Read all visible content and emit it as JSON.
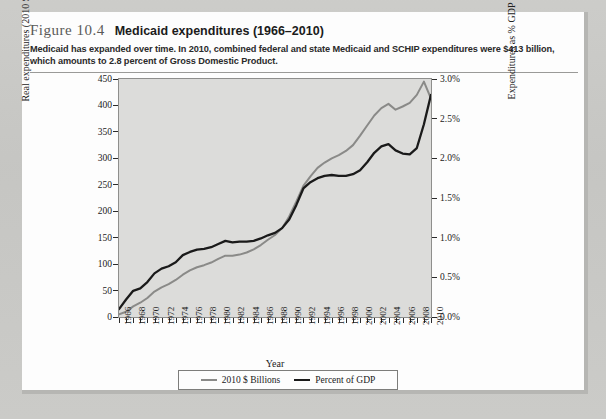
{
  "figure": {
    "label": "Figure 10.4",
    "title": "Medicaid expenditures (1966–2010)",
    "description": "Medicaid has expanded over time. In 2010, combined federal and state Medicaid and SCHIP expenditures were $413 billion, which amounts to 2.8 percent of Gross Domestic Product."
  },
  "legend": {
    "items": [
      {
        "label": "2010 $ Billions",
        "color": "#8a8a88"
      },
      {
        "label": "Percent of GDP",
        "color": "#1a1a1a"
      }
    ]
  },
  "chart_data": {
    "type": "line",
    "title": "Medicaid expenditures (1966–2010)",
    "xlabel": "Year",
    "ylabel": "Real expenditures (2010 $ billions)",
    "y2label": "Expenditures as % GDP",
    "xlim": [
      1966,
      2010
    ],
    "ylim": [
      0,
      450
    ],
    "y2lim": [
      0.0,
      3.0
    ],
    "grid": false,
    "legend_position": "bottom",
    "plot_background": "#dcdcda",
    "x": [
      1966,
      1967,
      1968,
      1969,
      1970,
      1971,
      1972,
      1973,
      1974,
      1975,
      1976,
      1977,
      1978,
      1979,
      1980,
      1981,
      1982,
      1983,
      1984,
      1985,
      1986,
      1987,
      1988,
      1989,
      1990,
      1991,
      1992,
      1993,
      1994,
      1995,
      1996,
      1997,
      1998,
      1999,
      2000,
      2001,
      2002,
      2003,
      2004,
      2005,
      2006,
      2007,
      2008,
      2009,
      2010
    ],
    "ytick_labels": [
      "0",
      "50",
      "100",
      "150",
      "200",
      "250",
      "300",
      "350",
      "400",
      "450"
    ],
    "ytick_values": [
      0,
      50,
      100,
      150,
      200,
      250,
      300,
      350,
      400,
      450
    ],
    "y2tick_labels": [
      "0.0%",
      "0.5%",
      "1.0%",
      "1.5%",
      "2.0%",
      "2.5%",
      "3.0%"
    ],
    "y2tick_values": [
      0.0,
      0.5,
      1.0,
      1.5,
      2.0,
      2.5,
      3.0
    ],
    "xtick_labels": [
      "1966",
      "1968",
      "1970",
      "1972",
      "1974",
      "1976",
      "1978",
      "1980",
      "1982",
      "1984",
      "1986",
      "1988",
      "1990",
      "1992",
      "1994",
      "1996",
      "1998",
      "2000",
      "2002",
      "2004",
      "2006",
      "2008",
      "2010"
    ],
    "series": [
      {
        "name": "2010 $ Billions",
        "axis": "left",
        "color": "#8a8a88",
        "values": [
          5,
          10,
          20,
          27,
          36,
          48,
          56,
          62,
          70,
          80,
          88,
          94,
          98,
          103,
          110,
          116,
          116,
          118,
          122,
          128,
          136,
          146,
          155,
          168,
          190,
          218,
          248,
          266,
          282,
          292,
          300,
          306,
          314,
          325,
          343,
          362,
          381,
          395,
          403,
          392,
          398,
          405,
          420,
          445,
          413
        ]
      },
      {
        "name": "Percent of GDP",
        "axis": "right",
        "color": "#1a1a1a",
        "values": [
          0.1,
          0.22,
          0.33,
          0.36,
          0.44,
          0.55,
          0.61,
          0.64,
          0.69,
          0.78,
          0.82,
          0.85,
          0.86,
          0.88,
          0.92,
          0.96,
          0.94,
          0.95,
          0.95,
          0.96,
          0.99,
          1.03,
          1.06,
          1.12,
          1.23,
          1.41,
          1.62,
          1.7,
          1.75,
          1.78,
          1.79,
          1.78,
          1.78,
          1.8,
          1.85,
          1.95,
          2.07,
          2.15,
          2.18,
          2.1,
          2.06,
          2.05,
          2.13,
          2.43,
          2.8
        ]
      }
    ],
    "annotations": []
  },
  "axis": {
    "x_title": "Year",
    "y_left_title": "Real expenditures (2010 $ billions)",
    "y_right_title": "Expenditures as % GDP"
  }
}
